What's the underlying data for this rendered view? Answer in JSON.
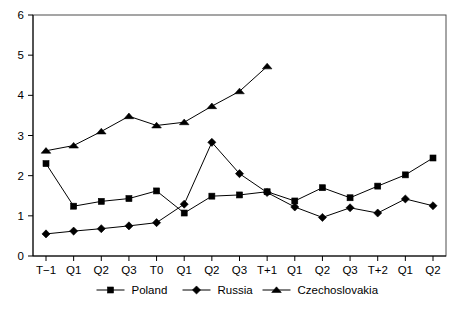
{
  "chart_data": {
    "type": "line",
    "title": "",
    "subtitle": "",
    "xlabel": "",
    "ylabel": "",
    "ylim": [
      0,
      6
    ],
    "yticks": [
      0,
      1,
      2,
      3,
      4,
      5,
      6
    ],
    "ytick_labels": [
      "0",
      "1",
      "2",
      "3",
      "4",
      "5",
      "6"
    ],
    "grid": false,
    "legend_position": "bottom",
    "categories": [
      "T−1",
      "Q1",
      "Q2",
      "Q3",
      "T0",
      "Q1",
      "Q2",
      "Q3",
      "T+1",
      "Q1",
      "Q2",
      "Q3",
      "T+2",
      "Q1",
      "Q2"
    ],
    "series": [
      {
        "name": "Poland",
        "marker": "square",
        "color": "#000000",
        "values": [
          2.3,
          1.24,
          1.36,
          1.43,
          1.62,
          1.07,
          1.49,
          1.52,
          1.6,
          1.37,
          1.7,
          1.45,
          1.74,
          2.02,
          2.44
        ]
      },
      {
        "name": "Russia",
        "marker": "diamond",
        "color": "#000000",
        "values": [
          0.55,
          0.62,
          0.68,
          0.75,
          0.83,
          1.29,
          2.83,
          2.05,
          1.58,
          1.22,
          0.96,
          1.2,
          1.07,
          1.42,
          1.25
        ]
      },
      {
        "name": "Czechoslovakia",
        "marker": "triangle",
        "color": "#000000",
        "values": [
          2.62,
          2.75,
          3.1,
          3.48,
          3.25,
          3.33,
          3.73,
          4.1,
          4.72,
          null,
          null,
          null,
          null,
          null,
          null
        ]
      }
    ]
  },
  "legend": {
    "items": [
      {
        "label": "Poland",
        "marker": "square-marker-icon"
      },
      {
        "label": "Russia",
        "marker": "diamond-marker-icon"
      },
      {
        "label": "Czechoslovakia",
        "marker": "triangle-marker-icon"
      }
    ]
  }
}
